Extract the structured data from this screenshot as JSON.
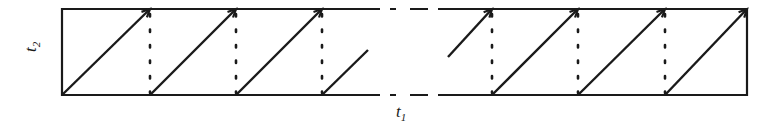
{
  "figure": {
    "title": "",
    "type": "diagram",
    "background_color": "#ffffff",
    "stroke_color": "#1a1a1a",
    "width": 781,
    "height": 131
  },
  "axes": {
    "vertical": {
      "label": "t",
      "subscript": "2",
      "orientation": "rotated-90",
      "x": 22,
      "y": 52
    },
    "horizontal": {
      "label": "t",
      "subscript": "1",
      "orientation": "horizontal",
      "x": 396,
      "y": 103
    }
  },
  "chart_data": {
    "type": "diagram",
    "title": "",
    "xlabel": "t1",
    "ylabel": "t2",
    "strip": {
      "top_y": 9,
      "bottom_y": 95,
      "left_x": 62,
      "right_x": 747,
      "gap_start_x": 378,
      "gap_end_x": 432,
      "border_style": "solid",
      "border_width": 2.2
    },
    "break_marks": {
      "style": "dashed",
      "dash_pattern": "18 10",
      "segments_top": [
        [
          362,
          9,
          396,
          9
        ],
        [
          410,
          9,
          448,
          9
        ]
      ],
      "segments_bottom": [
        [
          362,
          95,
          396,
          95
        ],
        [
          410,
          95,
          448,
          95
        ]
      ]
    },
    "diagonals": [
      {
        "x1": 62,
        "y1": 95,
        "x2": 150,
        "y2": 9,
        "arrow": true,
        "truncated": false
      },
      {
        "x1": 150,
        "y1": 95,
        "x2": 236,
        "y2": 9,
        "arrow": true,
        "truncated": false
      },
      {
        "x1": 236,
        "y1": 95,
        "x2": 322,
        "y2": 9,
        "arrow": true,
        "truncated": false
      },
      {
        "x1": 322,
        "y1": 95,
        "x2": 368,
        "y2": 50,
        "arrow": false,
        "truncated": true
      },
      {
        "x1": 448,
        "y1": 57,
        "x2": 492,
        "y2": 9,
        "arrow": true,
        "truncated": true
      },
      {
        "x1": 492,
        "y1": 95,
        "x2": 578,
        "y2": 9,
        "arrow": true,
        "truncated": false
      },
      {
        "x1": 578,
        "y1": 95,
        "x2": 665,
        "y2": 9,
        "arrow": true,
        "truncated": false
      },
      {
        "x1": 665,
        "y1": 95,
        "x2": 747,
        "y2": 9,
        "arrow": true,
        "truncated": false
      }
    ],
    "dotted_verticals": [
      {
        "x": 150,
        "y1": 14,
        "y2": 93
      },
      {
        "x": 236,
        "y1": 14,
        "y2": 93
      },
      {
        "x": 322,
        "y1": 14,
        "y2": 93
      },
      {
        "x": 492,
        "y1": 14,
        "y2": 93
      },
      {
        "x": 578,
        "y1": 14,
        "y2": 93
      },
      {
        "x": 665,
        "y1": 14,
        "y2": 93
      }
    ],
    "dotted_style": {
      "dash_pattern": "2.5 13",
      "width": 2.6,
      "linecap": "round"
    },
    "arrowhead": {
      "size": 9,
      "style": "open-v"
    }
  }
}
